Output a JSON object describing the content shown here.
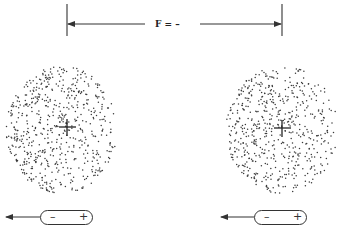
{
  "diagram": {
    "force_label": "F = –",
    "colors": {
      "ink": "#333333",
      "dots": "#3a3a3a",
      "background": "#ffffff"
    },
    "atoms": [
      {
        "id": "left-atom",
        "nucleus_symbol": "+",
        "nucleus_x": 67,
        "nucleus_y": 127,
        "cloud_cx": 62,
        "cloud_cy": 130,
        "cloud_rx": 56,
        "cloud_ry": 64,
        "dense_side": "left"
      },
      {
        "id": "right-atom",
        "nucleus_symbol": "+",
        "nucleus_x": 282,
        "nucleus_y": 128,
        "cloud_cx": 282,
        "cloud_cy": 130,
        "cloud_rx": 56,
        "cloud_ry": 64,
        "dense_side": "left"
      }
    ],
    "dipoles": [
      {
        "id": "left-dipole",
        "negative": "–",
        "positive": "+",
        "arrow_direction": "left"
      },
      {
        "id": "right-dipole",
        "negative": "–",
        "positive": "+",
        "arrow_direction": "left"
      }
    ]
  }
}
